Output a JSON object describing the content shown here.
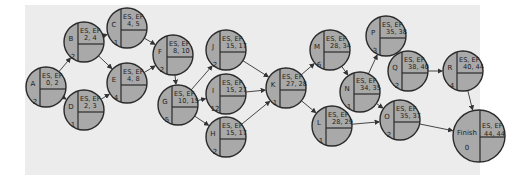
{
  "diagram": {
    "type": "activity-on-node network",
    "header_label": "ES, EF",
    "nodes": [
      {
        "id": "A",
        "es": 0,
        "ef": 2,
        "duration": 2
      },
      {
        "id": "B",
        "es": 2,
        "ef": 4,
        "duration": 2
      },
      {
        "id": "C",
        "es": 4,
        "ef": 5,
        "duration": 1
      },
      {
        "id": "D",
        "es": 2,
        "ef": 3,
        "duration": 1
      },
      {
        "id": "E",
        "es": 4,
        "ef": 8,
        "duration": 4
      },
      {
        "id": "F",
        "es": 8,
        "ef": 10,
        "duration": 2
      },
      {
        "id": "G",
        "es": 10,
        "ef": 15,
        "duration": 5
      },
      {
        "id": "J",
        "es": 15,
        "ef": 17,
        "duration": 2
      },
      {
        "id": "I",
        "es": 15,
        "ef": 27,
        "duration": 12
      },
      {
        "id": "H",
        "es": 15,
        "ef": 17,
        "duration": 2
      },
      {
        "id": "K",
        "es": 27,
        "ef": 28,
        "duration": 1
      },
      {
        "id": "M",
        "es": 28,
        "ef": 34,
        "duration": 6
      },
      {
        "id": "L",
        "es": 28,
        "ef": 29,
        "duration": 1
      },
      {
        "id": "N",
        "es": 34,
        "ef": 35,
        "duration": 1
      },
      {
        "id": "P",
        "es": 35,
        "ef": 38,
        "duration": 3
      },
      {
        "id": "Q",
        "es": 38,
        "ef": 40,
        "duration": 2
      },
      {
        "id": "O",
        "es": 35,
        "ef": 37,
        "duration": 2
      },
      {
        "id": "R",
        "es": 40,
        "ef": 44,
        "duration": 4
      },
      {
        "id": "Finish",
        "es": 44,
        "ef": 44,
        "duration": 0
      }
    ],
    "edges": [
      [
        "A",
        "B"
      ],
      [
        "A",
        "D"
      ],
      [
        "B",
        "C"
      ],
      [
        "B",
        "E"
      ],
      [
        "D",
        "E"
      ],
      [
        "C",
        "F"
      ],
      [
        "E",
        "F"
      ],
      [
        "F",
        "G"
      ],
      [
        "G",
        "J"
      ],
      [
        "G",
        "I"
      ],
      [
        "G",
        "H"
      ],
      [
        "J",
        "K"
      ],
      [
        "I",
        "K"
      ],
      [
        "H",
        "K"
      ],
      [
        "K",
        "M"
      ],
      [
        "K",
        "L"
      ],
      [
        "M",
        "N"
      ],
      [
        "N",
        "P"
      ],
      [
        "N",
        "O"
      ],
      [
        "L",
        "O"
      ],
      [
        "P",
        "Q"
      ],
      [
        "Q",
        "R"
      ],
      [
        "R",
        "Finish"
      ],
      [
        "O",
        "Finish"
      ]
    ]
  }
}
